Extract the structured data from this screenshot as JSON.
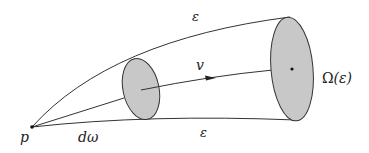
{
  "diagram": {
    "labels": {
      "epsilon_top": "ε",
      "epsilon_bottom": "ε",
      "velocity": "v",
      "region_prefix": "Ω",
      "region_arg": "(ε)",
      "point": "p",
      "solid_angle": "dω"
    },
    "colors": {
      "stroke": "#333333",
      "fill": "#c8c8c8",
      "background": "#ffffff"
    }
  }
}
